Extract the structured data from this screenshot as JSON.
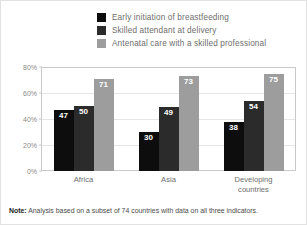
{
  "legend": {
    "items": [
      {
        "label": "Early initiation of breastfeeding",
        "color": "#0d0d0d"
      },
      {
        "label": "Skilled attendant at delivery",
        "color": "#2b2b2b"
      },
      {
        "label": "Antenatal care with a skilled professional",
        "color": "#9d9d9d"
      }
    ]
  },
  "note": {
    "label": "Note:",
    "text": " Analysis based on a subset of 74 countries with data on all three indicators."
  },
  "chart_data": {
    "type": "bar",
    "title": "",
    "xlabel": "",
    "ylabel": "",
    "ylim": [
      0,
      80
    ],
    "yticks": [
      "0%",
      "20%",
      "40%",
      "60%",
      "80%"
    ],
    "ytick_values": [
      0,
      20,
      40,
      60,
      80
    ],
    "grid": true,
    "legend_position": "top-right",
    "categories": [
      "Africa",
      "Asia",
      "Developing countries"
    ],
    "category_lines": [
      [
        "Africa"
      ],
      [
        "Asia"
      ],
      [
        "Developing",
        "countries"
      ]
    ],
    "series": [
      {
        "name": "Early initiation of breastfeeding",
        "color": "#0d0d0d",
        "values": [
          47,
          30,
          38
        ]
      },
      {
        "name": "Skilled attendant at delivery",
        "color": "#2b2b2b",
        "values": [
          50,
          49,
          54
        ]
      },
      {
        "name": "Antenatal care with a skilled professional",
        "color": "#9d9d9d",
        "values": [
          71,
          73,
          75
        ]
      }
    ]
  }
}
